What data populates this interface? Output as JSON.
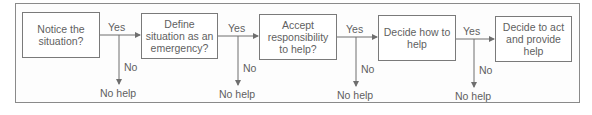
{
  "diagram": {
    "type": "flowchart",
    "steps": [
      {
        "label": "Notice the situation?"
      },
      {
        "label": "Define situation as an emergency?"
      },
      {
        "label": "Accept responsibility to help?"
      },
      {
        "label": "Decide how to help"
      },
      {
        "label": "Decide to act and provide help"
      }
    ],
    "branches": [
      {
        "yes": "Yes",
        "no": "No",
        "outcome": "No help"
      },
      {
        "yes": "Yes",
        "no": "No",
        "outcome": "No help"
      },
      {
        "yes": "Yes",
        "no": "No",
        "outcome": "No help"
      },
      {
        "yes": "Yes",
        "no": "No",
        "outcome": "No help"
      }
    ],
    "colors": {
      "line": "#6e6e6e",
      "text": "#5f5f5f",
      "frame": "#8a8a8a"
    }
  }
}
